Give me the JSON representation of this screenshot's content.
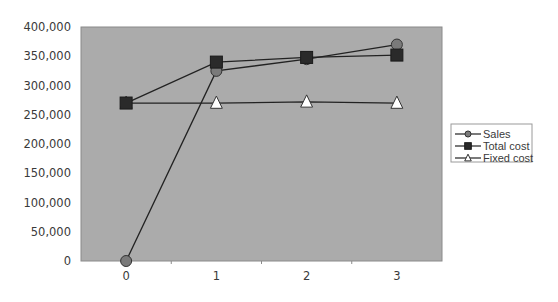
{
  "chart_data": {
    "type": "line",
    "title": "",
    "xlabel": "",
    "ylabel": "",
    "categories": [
      "0",
      "1",
      "2",
      "3"
    ],
    "x": [
      0,
      1,
      2,
      3
    ],
    "series": [
      {
        "name": "Sales",
        "marker": "circle",
        "values": [
          0,
          325000,
          345000,
          370000
        ]
      },
      {
        "name": "Total cost",
        "marker": "square",
        "values": [
          270000,
          340000,
          348000,
          352000
        ]
      },
      {
        "name": "Fixed cost",
        "marker": "triangle",
        "values": [
          270000,
          270000,
          272000,
          270000
        ]
      }
    ],
    "ylim": [
      0,
      400000
    ],
    "yticks": [
      "0",
      "50,000",
      "100,000",
      "150,000",
      "200,000",
      "250,000",
      "300,000",
      "350,000",
      "400,000"
    ],
    "xticks": [
      "0",
      "1",
      "2",
      "3"
    ],
    "grid": false,
    "legend_position": "right",
    "colors": {
      "plot_background": "#ababab",
      "plot_border": "#8a8a8a",
      "line": "#222222",
      "circle_fill": "#7a7a7a",
      "square_fill": "#2a2a2a",
      "triangle_fill": "#ffffff"
    }
  }
}
